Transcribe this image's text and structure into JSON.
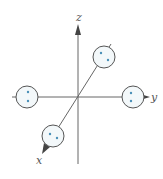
{
  "diagram": {
    "type": "3d-axes-with-orbitals",
    "colors": {
      "axis": "#666666",
      "circle_stroke": "#555555",
      "circle_fill": "#eef5f8",
      "dot": "#4a90b8",
      "label": "#555555"
    },
    "axes": {
      "z": {
        "label": "z"
      },
      "y": {
        "label": "y"
      },
      "x": {
        "label": "x"
      }
    },
    "lobes": [
      {
        "name": "lobe-upper-back-x",
        "dots": 2
      },
      {
        "name": "lobe-negative-y",
        "dots": 2
      },
      {
        "name": "lobe-positive-y",
        "dots": 2
      },
      {
        "name": "lobe-positive-x",
        "dots": 2
      }
    ]
  }
}
